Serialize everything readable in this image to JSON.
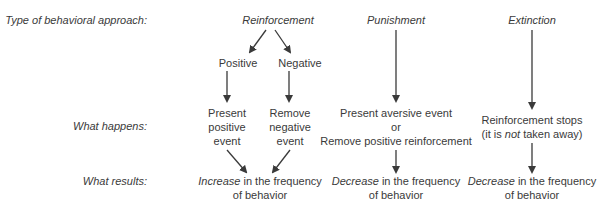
{
  "row_labels": {
    "type": "Type of behavioral approach:",
    "happens": "What happens:",
    "results": "What results:"
  },
  "reinforcement": {
    "title": "Reinforcement",
    "positive": {
      "label": "Positive",
      "happens": [
        "Present",
        "positive",
        "event"
      ]
    },
    "negative": {
      "label": "Negative",
      "happens": [
        "Remove",
        "negative",
        "event"
      ]
    },
    "result_em": "Increase",
    "result_rest": " in the frequency",
    "result_line2": "of behavior"
  },
  "punishment": {
    "title": "Punishment",
    "happens": [
      "Present aversive event",
      "or",
      "Remove positive reinforcement"
    ],
    "result_em": "Decrease",
    "result_rest": " in the frequency",
    "result_line2": "of behavior"
  },
  "extinction": {
    "title": "Extinction",
    "happens_line1": "Reinforcement stops",
    "happens_pre": "(it is ",
    "happens_em": "not",
    "happens_post": " taken away)",
    "result_em": "Decrease",
    "result_rest": " in the frequency",
    "result_line2": "of behavior"
  },
  "colors": {
    "text": "#3a3a3a",
    "arrow": "#3a3a3a"
  }
}
